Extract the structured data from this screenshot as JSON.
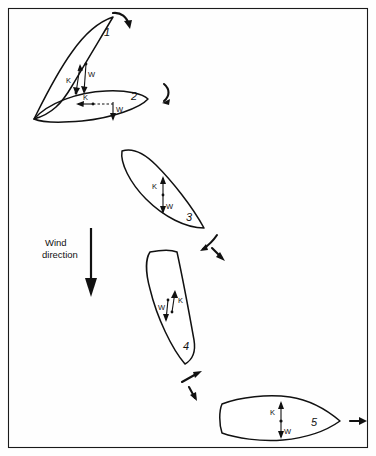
{
  "figure": {
    "name": "ship-capsize-sequence",
    "background_color": "#fefefe",
    "ink_color": "#111111",
    "frame": {
      "visible": true,
      "x": 8,
      "y": 8,
      "width": 360,
      "height": 440
    }
  },
  "wind": {
    "label_line1": "Wind",
    "label_line2": "direction",
    "arrow_direction": "down",
    "arrow_x": 91,
    "arrow_y_start": 228,
    "arrow_y_end": 296
  },
  "vector_labels": {
    "buoyancy": "K",
    "weight": "W"
  },
  "positions": [
    {
      "number": "1",
      "label_x": 104,
      "label_y": 36,
      "attitude": "heeled-steeply-nearly-vertical",
      "vectors": [
        {
          "name": "K",
          "label": "K",
          "direction": "down",
          "label_x": 68,
          "label_y": 80
        },
        {
          "name": "W",
          "label": "W",
          "direction": "down",
          "label_x": 90,
          "label_y": 76
        }
      ],
      "rotation_arrow": "clockwise-top-right"
    },
    {
      "number": "2",
      "label_x": 131,
      "label_y": 100,
      "attitude": "capsized-horizontal",
      "vectors": [
        {
          "name": "K",
          "label": "K",
          "direction": "left",
          "label_x": 84,
          "label_y": 101
        },
        {
          "name": "W",
          "label": "W",
          "direction": "down",
          "label_x": 109,
          "label_y": 110
        }
      ],
      "rotation_arrow": "clockwise-right"
    },
    {
      "number": "3",
      "label_x": 186,
      "label_y": 221,
      "attitude": "heeled-moderate",
      "vectors": [
        {
          "name": "K",
          "label": "K",
          "direction": "up",
          "label_x": 148,
          "label_y": 187
        },
        {
          "name": "W",
          "label": "W",
          "direction": "down",
          "label_x": 166,
          "label_y": 206
        }
      ],
      "rotation_arrow": "clockwise-lower-right"
    },
    {
      "number": "4",
      "label_x": 183,
      "label_y": 350,
      "attitude": "heeled-moderate-blunt-top",
      "vectors": [
        {
          "name": "W",
          "label": "W",
          "direction": "down",
          "label_x": 160,
          "label_y": 313
        },
        {
          "name": "K",
          "label": "K",
          "direction": "up",
          "label_x": 180,
          "label_y": 300
        }
      ],
      "rotation_arrow": "counterclockwise-lower"
    },
    {
      "number": "5",
      "label_x": 315,
      "label_y": 425,
      "attitude": "upright-horizontal",
      "vectors": [
        {
          "name": "K",
          "label": "K",
          "direction": "up",
          "label_x": 269,
          "label_y": 413
        },
        {
          "name": "W",
          "label": "W",
          "direction": "down",
          "label_x": 285,
          "label_y": 431
        }
      ],
      "rotation_arrow": "straight-right"
    }
  ]
}
